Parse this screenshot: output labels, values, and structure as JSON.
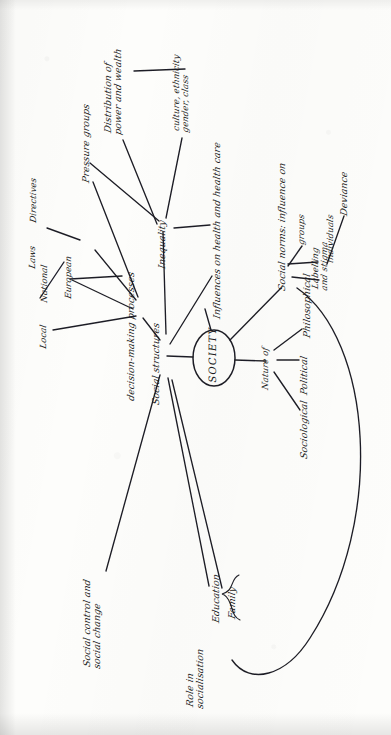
{
  "document": {
    "kind": "hand-drawn mind map photograph",
    "orientation": "rotated 90 degrees counter-clockwise; text reads bottom-to-top",
    "ink_color": "#1c1c22",
    "paper_color": "#fdfdfb"
  },
  "center": {
    "label": "SOCIETY",
    "shape": "ellipse"
  },
  "nodes": {
    "laws": "Laws",
    "directives": "Directives",
    "local": "Local",
    "national": "National",
    "european": "European",
    "decision_making": "decision-making processes",
    "social_structures": "Social structures",
    "pressure_groups": "Pressure groups",
    "distribution": "Distribution of\npower and wealth",
    "culture": "culture, ethnicity\ngender, class",
    "inequality": "Inequality",
    "influences_health": "Influences on health and health care",
    "social_norms": "Social norms: influence on",
    "groups": "groups",
    "individuals": "individuals",
    "labelling": "Labelling\nand stigma",
    "deviance": "Deviance",
    "nature_of": "Nature of",
    "sociological": "Sociological",
    "political": "Political",
    "philosophical": "Philosophical",
    "social_control": "Social control and\nsocial change",
    "role_socialisation": "Role in\nsocialisation",
    "education": "Education",
    "family": "Family"
  },
  "edges": [
    {
      "from": "society",
      "to": "social_structures"
    },
    {
      "from": "society",
      "to": "influences_health"
    },
    {
      "from": "society",
      "to": "social_norms"
    },
    {
      "from": "society",
      "to": "nature_of"
    },
    {
      "from": "social_structures",
      "to": "decision_making"
    },
    {
      "from": "social_structures",
      "to": "inequality"
    },
    {
      "from": "social_structures",
      "to": "social_control"
    },
    {
      "from": "social_structures",
      "to": "role_socialisation"
    },
    {
      "from": "decision_making",
      "to": "local"
    },
    {
      "from": "decision_making",
      "to": "national"
    },
    {
      "from": "decision_making",
      "to": "european"
    },
    {
      "from": "decision_making",
      "to": "pressure_groups"
    },
    {
      "from": "national",
      "to": "laws"
    },
    {
      "from": "european",
      "to": "directives"
    },
    {
      "from": "inequality",
      "to": "distribution"
    },
    {
      "from": "inequality",
      "to": "culture"
    },
    {
      "from": "inequality",
      "to": "pressure_groups"
    },
    {
      "from": "inequality",
      "to": "influences_health"
    },
    {
      "from": "social_norms",
      "to": "groups"
    },
    {
      "from": "social_norms",
      "to": "individuals"
    },
    {
      "from": "social_norms",
      "to": "labelling"
    },
    {
      "from": "labelling",
      "to": "deviance"
    },
    {
      "from": "nature_of",
      "to": "sociological"
    },
    {
      "from": "nature_of",
      "to": "political"
    },
    {
      "from": "nature_of",
      "to": "philosophical"
    },
    {
      "from": "role_socialisation",
      "to": "education"
    },
    {
      "from": "role_socialisation",
      "to": "family"
    },
    {
      "from": "social_norms",
      "to": "role_socialisation",
      "style": "long-curve"
    }
  ],
  "brace": {
    "label": "brace-grouping-education-family"
  }
}
